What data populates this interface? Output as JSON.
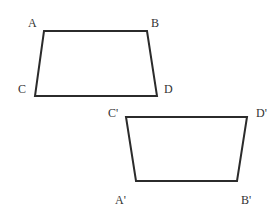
{
  "diagram": {
    "type": "geometry-trapezoid-reflection",
    "colors": {
      "stroke": "#2b2b2b",
      "label": "#333333",
      "background": "#ffffff"
    },
    "figures": [
      {
        "name": "ABDC",
        "vertices": [
          {
            "label": "A",
            "x": 44,
            "y": 31,
            "label_x": 28,
            "label_y": 27
          },
          {
            "label": "B",
            "x": 147,
            "y": 31,
            "label_x": 151,
            "label_y": 27
          },
          {
            "label": "D",
            "x": 157,
            "y": 96,
            "label_x": 164,
            "label_y": 93
          },
          {
            "label": "C",
            "x": 35,
            "y": 96,
            "label_x": 18,
            "label_y": 93
          }
        ]
      },
      {
        "name": "C'D'B'A'",
        "vertices": [
          {
            "label": "C'",
            "x": 126,
            "y": 117,
            "label_x": 108,
            "label_y": 117
          },
          {
            "label": "D'",
            "x": 247,
            "y": 117,
            "label_x": 256,
            "label_y": 117
          },
          {
            "label": "B'",
            "x": 237,
            "y": 181,
            "label_x": 241,
            "label_y": 204
          },
          {
            "label": "A'",
            "x": 136,
            "y": 181,
            "label_x": 115,
            "label_y": 204
          }
        ]
      }
    ]
  }
}
